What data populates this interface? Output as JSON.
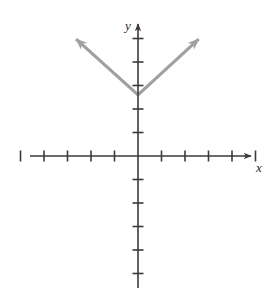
{
  "figure": {
    "name": "coordinate-plane-absolute-value-graph",
    "width": 276,
    "height": 297,
    "background": "#ffffff"
  },
  "axes": {
    "color": "#3a3a3a",
    "stroke_width": 1.6,
    "origin": {
      "x": 138,
      "y": 156
    },
    "unit_px": 23.5,
    "x_axis": {
      "label": "x",
      "label_pos": {
        "x": 259,
        "y": 172
      },
      "start": {
        "x": 30,
        "y": 156
      },
      "end": {
        "x": 253,
        "y": 156
      },
      "arrow_end": "right",
      "tick_length": 11,
      "ticks_negative": 5,
      "ticks_positive": 5
    },
    "y_axis": {
      "label": "y",
      "label_pos": {
        "x": 128,
        "y": 30
      },
      "start": {
        "x": 138,
        "y": 288
      },
      "end": {
        "x": 138,
        "y": 22
      },
      "arrow_end": "up",
      "tick_length": 11,
      "ticks_positive": 5,
      "ticks_negative": 5
    }
  },
  "chart_data": {
    "type": "line",
    "title": "",
    "xlabel": "x",
    "ylabel": "y",
    "xlim": [
      -5,
      5
    ],
    "ylim": [
      -5,
      5
    ],
    "grid": false,
    "legend": false,
    "curve_color": "#a0a0a0",
    "curve_stroke_width": 3.2,
    "vertex": {
      "x": 0,
      "y": 2.6
    },
    "slope_left": -1,
    "slope_right": 1,
    "series": [
      {
        "name": "left-ray",
        "points": [
          {
            "x": 0,
            "y": 2.6
          },
          {
            "x": -2.77,
            "y": 5.1
          }
        ],
        "arrow_at_end": true
      },
      {
        "name": "right-ray",
        "points": [
          {
            "x": 0,
            "y": 2.6
          },
          {
            "x": 2.72,
            "y": 5.1
          }
        ],
        "arrow_at_end": true
      }
    ]
  },
  "pixels": {
    "vertex": {
      "x": 138,
      "y": 95
    },
    "left_tip": {
      "x": 73,
      "y": 36
    },
    "right_tip": {
      "x": 203,
      "y": 36
    }
  }
}
